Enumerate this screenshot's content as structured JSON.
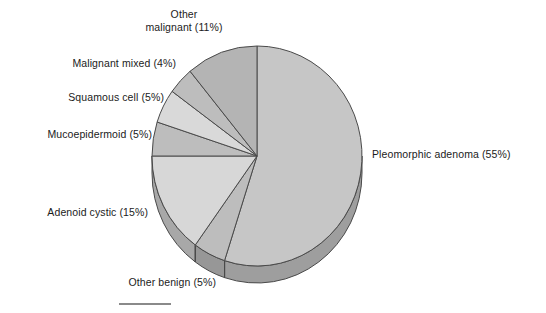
{
  "figure": {
    "kind": "pie-chart",
    "background_color": "#ffffff",
    "text_color": "#1b1b1b",
    "rule": {
      "name": "figure-rule",
      "color": "#8a8a8a"
    }
  },
  "chart_data": {
    "type": "pie",
    "title": "",
    "subtitle": "",
    "xlabel": "",
    "ylabel": "",
    "legend_position": "none",
    "labels_position": "outside-callout",
    "grid": false,
    "three_d": true,
    "start_angle_deg": 0,
    "direction": "clockwise",
    "units": "percent",
    "total": 100,
    "categories": [
      "Pleomorphic adenoma",
      "Other benign",
      "Adenoid cystic",
      "Mucoepidermoid",
      "Squamous cell",
      "Malignant mixed",
      "Other malignant"
    ],
    "values": [
      55,
      5,
      15,
      5,
      5,
      4,
      11
    ],
    "slices": [
      {
        "name": "pleomorphic-adenoma",
        "label": "Pleomorphic adenoma (55%)",
        "category": "Pleomorphic adenoma",
        "value": 55,
        "top_color": "#c6c6c6",
        "side_color": "#9e9e9e"
      },
      {
        "name": "other-benign",
        "label": "Other benign (5%)",
        "category": "Other benign",
        "value": 5,
        "top_color": "#bdbdbd",
        "side_color": "#979797"
      },
      {
        "name": "adenoid-cystic",
        "label": "Adenoid cystic (15%)",
        "category": "Adenoid cystic",
        "value": 15,
        "top_color": "#d7d7d7",
        "side_color": "#a8a8a8"
      },
      {
        "name": "mucoepidermoid",
        "label": "Mucoepidermoid (5%)",
        "category": "Mucoepidermoid",
        "value": 5,
        "top_color": "#bdbdbd",
        "side_color": "#979797"
      },
      {
        "name": "squamous-cell",
        "label": "Squamous cell (5%)",
        "category": "Squamous cell",
        "value": 5,
        "top_color": "#d9d9d9",
        "side_color": "#aaaaaa"
      },
      {
        "name": "malignant-mixed",
        "label": "Malignant mixed (4%)",
        "category": "Malignant mixed",
        "value": 4,
        "top_color": "#bdbdbd",
        "side_color": "#979797"
      },
      {
        "name": "other-malignant",
        "label": "Other\nmalignant (11%)",
        "category": "Other malignant",
        "value": 11,
        "top_color": "#b4b4b4",
        "side_color": "#909090"
      }
    ],
    "outline_color": "#4a4a4a"
  }
}
